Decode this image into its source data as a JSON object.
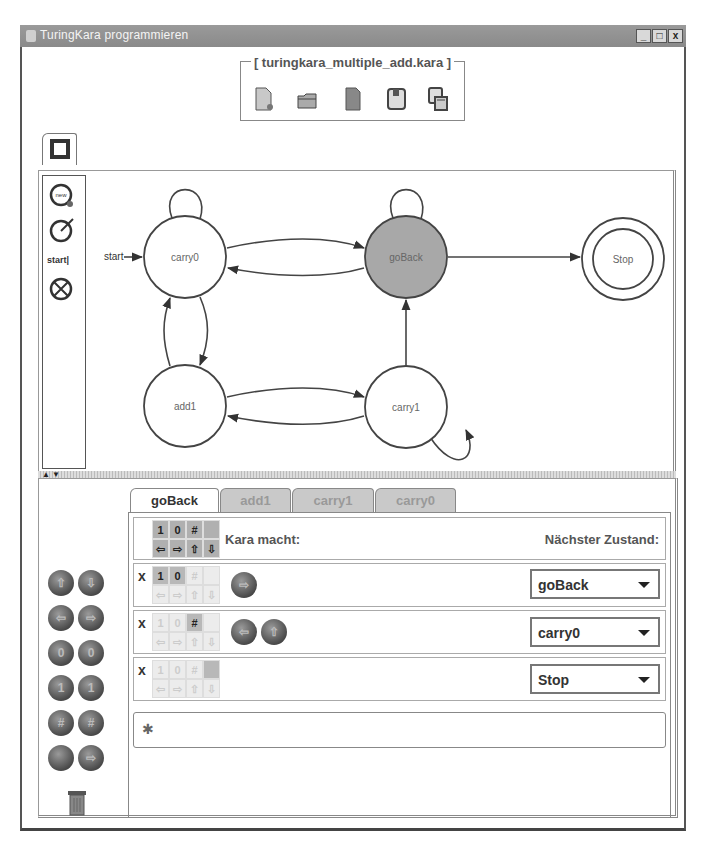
{
  "window": {
    "title": "TuringKara programmieren",
    "controls": {
      "minimize": "_",
      "maximize": "□",
      "close": "x"
    }
  },
  "file": {
    "name": "[ turingkara_multiple_add.kara ]",
    "tools": [
      {
        "name": "new-file-icon"
      },
      {
        "name": "open-folder-icon"
      },
      {
        "name": "document-icon"
      },
      {
        "name": "save-icon"
      },
      {
        "name": "save-as-icon"
      }
    ]
  },
  "world_tab": {
    "icon": "world-square-icon"
  },
  "palette": {
    "items": [
      {
        "name": "new-state-icon"
      },
      {
        "name": "edit-state-icon"
      },
      {
        "name": "start-state-tool",
        "label": "start"
      },
      {
        "name": "delete-state-icon"
      }
    ]
  },
  "graph": {
    "start_label": "start",
    "states": [
      {
        "id": "carry0",
        "label": "carry0",
        "x": 185,
        "y": 257,
        "selected": false,
        "final": false
      },
      {
        "id": "goBack",
        "label": "goBack",
        "x": 406,
        "y": 257,
        "selected": true,
        "final": false
      },
      {
        "id": "Stop",
        "label": "Stop",
        "x": 623,
        "y": 259,
        "selected": false,
        "final": true
      },
      {
        "id": "add1",
        "label": "add1",
        "x": 185,
        "y": 406,
        "selected": false,
        "final": false
      },
      {
        "id": "carry1",
        "label": "carry1",
        "x": 406,
        "y": 407,
        "selected": false,
        "final": false
      }
    ],
    "transitions": [
      [
        "carry0",
        "carry0"
      ],
      [
        "carry0",
        "goBack"
      ],
      [
        "goBack",
        "carry0"
      ],
      [
        "goBack",
        "goBack"
      ],
      [
        "goBack",
        "Stop"
      ],
      [
        "carry0",
        "add1"
      ],
      [
        "add1",
        "carry0"
      ],
      [
        "add1",
        "carry1"
      ],
      [
        "carry1",
        "add1"
      ],
      [
        "carry1",
        "goBack"
      ],
      [
        "carry1",
        "carry1"
      ]
    ]
  },
  "splitter": {
    "up": "▲",
    "down": "▼"
  },
  "keypad": {
    "buttons": [
      {
        "name": "move-up-button",
        "glyph": "⇧"
      },
      {
        "name": "move-down-button",
        "glyph": "⇩"
      },
      {
        "name": "move-left-button",
        "glyph": "⇦"
      },
      {
        "name": "move-right-button",
        "glyph": "⇨"
      },
      {
        "name": "put-0-button",
        "glyph": "0"
      },
      {
        "name": "read-0-button",
        "glyph": "0"
      },
      {
        "name": "put-1-button",
        "glyph": "1"
      },
      {
        "name": "read-1-button",
        "glyph": "1"
      },
      {
        "name": "put-hash-button",
        "glyph": "#"
      },
      {
        "name": "read-hash-button",
        "glyph": "#"
      },
      {
        "name": "put-empty-button",
        "glyph": ""
      },
      {
        "name": "read-empty-button",
        "glyph": "⇨"
      }
    ],
    "trash": "trash-icon"
  },
  "tabs": [
    {
      "label": "goBack",
      "active": true
    },
    {
      "label": "add1",
      "active": false
    },
    {
      "label": "carry1",
      "active": false
    },
    {
      "label": "carry0",
      "active": false
    }
  ],
  "rules": {
    "header": {
      "symbols": [
        "1",
        "0",
        "#",
        ""
      ],
      "moves": [
        "⇦",
        "⇨",
        "⇧",
        "⇩"
      ],
      "kara_does": "Kara macht:",
      "next_state": "Nächster Zustand:"
    },
    "rows": [
      {
        "x": "x",
        "read": [
          "1",
          "0",
          "#",
          ""
        ],
        "active": [
          true,
          true,
          false,
          false
        ],
        "actions": [
          "⇨"
        ],
        "next": "goBack"
      },
      {
        "x": "x",
        "read": [
          "1",
          "0",
          "#",
          ""
        ],
        "active": [
          false,
          false,
          true,
          false
        ],
        "actions": [
          "⇦",
          "⇧"
        ],
        "next": "carry0"
      },
      {
        "x": "x",
        "read": [
          "1",
          "0",
          "#",
          ""
        ],
        "active": [
          false,
          false,
          false,
          true
        ],
        "actions": [],
        "next": "Stop"
      }
    ],
    "add_rule": "✱"
  }
}
